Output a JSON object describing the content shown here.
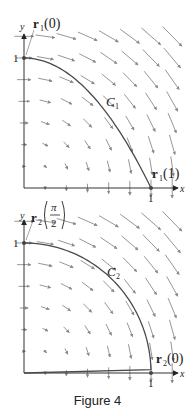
{
  "caption": "Figure 4",
  "colors": {
    "curve": "#4a4a4a",
    "axis": "#333333",
    "arrow": "#8a8a8a",
    "text": "#222222"
  },
  "field": {
    "formula": "F(x,y) = y i - x j",
    "grid_step": 0.1667,
    "arrow_scale": 0.13
  },
  "panels": [
    {
      "id": "panel-1",
      "origin_px": [
        24,
        188
      ],
      "unit_px": [
        127,
        130
      ],
      "curve_label": "C",
      "curve_sub": "1",
      "start_label": {
        "main": "r",
        "sub": "1",
        "arg": "(0)"
      },
      "end_label": {
        "main": "r",
        "sub": "1",
        "arg": "(1)"
      },
      "axis_x_label": "x",
      "axis_y_label": "y",
      "tick_x": "1",
      "tick_y": "1",
      "curve_type": "r1"
    },
    {
      "id": "panel-2",
      "origin_px": [
        24,
        373
      ],
      "unit_px": [
        127,
        130
      ],
      "curve_label": "C",
      "curve_sub": "2",
      "start_label": {
        "main": "r",
        "sub": "2",
        "arg_num": "π",
        "arg_den": "2"
      },
      "end_label": {
        "main": "r",
        "sub": "2",
        "arg": "(0)"
      },
      "axis_x_label": "x",
      "axis_y_label": "y",
      "tick_x": "1",
      "tick_y": "1",
      "curve_type": "r2"
    }
  ]
}
